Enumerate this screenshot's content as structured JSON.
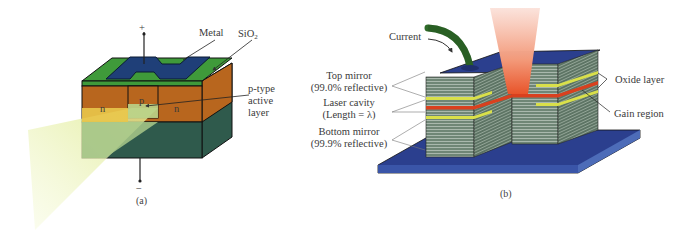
{
  "panel_a": {
    "caption": "(a)",
    "labels": {
      "metal": "Metal",
      "sio2_main": "SiO",
      "sio2_sub": "2",
      "p_type_line1": "p-type",
      "p_type_line2": "active",
      "p_type_line3": "layer",
      "n_left": "n",
      "n_right": "n",
      "p_region": "p",
      "plus": "+",
      "minus": "−"
    },
    "colors": {
      "metal": "#1f3f78",
      "sio2": "#3f9a3a",
      "n_region": "#b8661e",
      "substrate": "#2e5a4a",
      "light_beam": "#eaf2a8",
      "active_layer": "#e9c64a"
    }
  },
  "panel_b": {
    "caption": "(b)",
    "labels": {
      "current": "Current",
      "top_mirror_line1": "Top mirror",
      "top_mirror_line2": "(99.0% reflective)",
      "laser_cavity_line1": "Laser cavity",
      "laser_cavity_line2": "(Length = λ)",
      "bottom_mirror_line1": "Bottom mirror",
      "bottom_mirror_line2": "(99.9% reflective)",
      "oxide_layer": "Oxide layer",
      "gain_region": "Gain region"
    },
    "colors": {
      "contact": "#2b3f8e",
      "mirror_stack": "#6f8a78",
      "oxide": "#d9e04a",
      "gain": "#d9401e",
      "wire": "#2f6b2a",
      "beam": "#f08a6a"
    }
  }
}
